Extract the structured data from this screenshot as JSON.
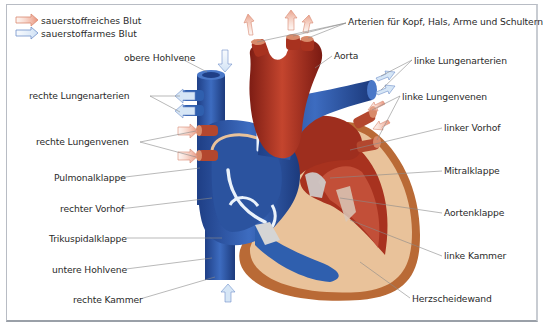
{
  "legend": {
    "items": [
      {
        "label": "sauerstoffreiches Blut",
        "color": "#e58a6e"
      },
      {
        "label": "sauerstoffarmes Blut",
        "color": "#6f8fc9"
      }
    ]
  },
  "colors": {
    "oxygen_rich": "#b23a2a",
    "oxygen_poor": "#2f5fae",
    "septum": "#e9c29a",
    "frame": "#b8bcc4"
  },
  "labels": {
    "left": [
      {
        "id": "obere-hohlvene",
        "text": "obere Hohlvene"
      },
      {
        "id": "rechte-lungenarterien",
        "text": "rechte Lungenarterien"
      },
      {
        "id": "rechte-lungenvenen",
        "text": "rechte Lungenvenen"
      },
      {
        "id": "pulmonalklappe",
        "text": "Pulmonalklappe"
      },
      {
        "id": "rechter-vorhof",
        "text": "rechter Vorhof"
      },
      {
        "id": "trikuspidalklappe",
        "text": "Trikuspidalklappe"
      },
      {
        "id": "untere-hohlvene",
        "text": "untere Hohlvene"
      },
      {
        "id": "rechte-kammer",
        "text": "rechte Kammer"
      }
    ],
    "right": [
      {
        "id": "arterien-kopf",
        "text": "Arterien für Kopf, Hals, Arme und Schultern"
      },
      {
        "id": "aorta",
        "text": "Aorta"
      },
      {
        "id": "linke-lungenarterien",
        "text": "linke Lungenarterien"
      },
      {
        "id": "linke-lungenvenen",
        "text": "linke Lungenvenen"
      },
      {
        "id": "linker-vorhof",
        "text": "linker Vorhof"
      },
      {
        "id": "mitralklappe",
        "text": "Mitralklappe"
      },
      {
        "id": "aortenklappe",
        "text": "Aortenklappe"
      },
      {
        "id": "linke-kammer",
        "text": "linke Kammer"
      },
      {
        "id": "herzscheidewand",
        "text": "Herzscheidewand"
      }
    ]
  }
}
